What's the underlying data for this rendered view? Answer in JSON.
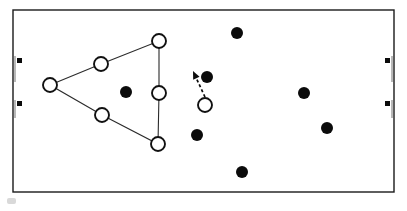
{
  "figure": {
    "width": 407,
    "height": 211,
    "background_color": "#ffffff"
  },
  "pitch": {
    "label": "pitch-outline",
    "x": 13,
    "y": 10,
    "width": 381,
    "height": 182,
    "stroke_color": "#1a1a1a",
    "fill_color": "#ffffff"
  },
  "goals": [
    {
      "side": "left",
      "label": "left-goal",
      "post_x": 15,
      "top_cap_y": 57,
      "bottom_cap_y": 104,
      "line_color": "#8a8a8a",
      "cap_color": "#0b0b0b"
    },
    {
      "side": "right",
      "label": "right-goal",
      "post_x": 392,
      "top_cap_y": 57,
      "bottom_cap_y": 104,
      "line_color": "#8a8a8a",
      "cap_color": "#0b0b0b"
    }
  ],
  "chart_data": {
    "type": "scatter",
    "xlabel": "",
    "ylabel": "",
    "xlim": [
      13,
      394
    ],
    "ylim": [
      10,
      192
    ],
    "grid": false,
    "legend": "none",
    "series": [
      {
        "name": "Open circles (team A / defending shape)",
        "marker": "open-circle",
        "marker_color": "#ffffff",
        "edge_color": "#111111",
        "radius": 7,
        "points": [
          {
            "id": "open-1",
            "x": 50,
            "y": 85,
            "role": "hull-vertex-left"
          },
          {
            "id": "open-2",
            "x": 101,
            "y": 64,
            "role": "hull-vertex-upper"
          },
          {
            "id": "open-3",
            "x": 159,
            "y": 41,
            "role": "hull-vertex-top"
          },
          {
            "id": "open-4",
            "x": 159,
            "y": 93,
            "role": "hull-vertex-right"
          },
          {
            "id": "open-5",
            "x": 158,
            "y": 144,
            "role": "hull-vertex-bottom"
          },
          {
            "id": "open-6",
            "x": 102,
            "y": 115,
            "role": "hull-vertex-lower"
          },
          {
            "id": "open-7",
            "x": 205,
            "y": 105,
            "role": "moving-player"
          }
        ]
      },
      {
        "name": "Filled circles (team B / attacking players)",
        "marker": "filled-circle",
        "marker_color": "#0b0b0b",
        "radius": 6,
        "points": [
          {
            "id": "filled-1",
            "x": 126,
            "y": 92,
            "role": "inside-hull"
          },
          {
            "id": "filled-2",
            "x": 207,
            "y": 77,
            "role": "target"
          },
          {
            "id": "filled-3",
            "x": 237,
            "y": 33,
            "role": "upper-right"
          },
          {
            "id": "filled-4",
            "x": 197,
            "y": 135,
            "role": "lower-center"
          },
          {
            "id": "filled-5",
            "x": 242,
            "y": 172,
            "role": "lower-center-right"
          },
          {
            "id": "filled-6",
            "x": 304,
            "y": 93,
            "role": "right-mid"
          },
          {
            "id": "filled-7",
            "x": 327,
            "y": 128,
            "role": "right-low"
          }
        ]
      }
    ],
    "hull_polygon": {
      "name": "convex-hull",
      "closed": true,
      "stroke_color": "#2b2b2b",
      "vertices": [
        {
          "x": 50,
          "y": 85
        },
        {
          "x": 101,
          "y": 64
        },
        {
          "x": 159,
          "y": 41
        },
        {
          "x": 159,
          "y": 93
        },
        {
          "x": 158,
          "y": 144
        },
        {
          "x": 102,
          "y": 115
        }
      ]
    },
    "annotations": [
      {
        "id": "movement-arrow",
        "type": "dashed-arrow",
        "from_x": 205,
        "from_y": 97,
        "to_x": 193,
        "to_y": 71,
        "color": "#0b0b0b",
        "dashed": true,
        "description": "movement direction of open circle toward filled circle"
      }
    ]
  }
}
